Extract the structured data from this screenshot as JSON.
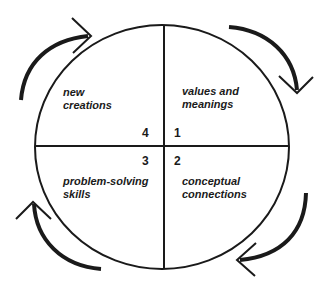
{
  "diagram": {
    "type": "cycle",
    "quadrants": [
      {
        "number": "1",
        "line1": "values and",
        "line2": "meanings",
        "position": "top-right"
      },
      {
        "number": "2",
        "line1": "conceptual",
        "line2": "connections",
        "position": "bottom-right"
      },
      {
        "number": "3",
        "line1": "problem-solving",
        "line2": "skills",
        "position": "bottom-left"
      },
      {
        "number": "4",
        "line1": "new",
        "line2": "creations",
        "position": "top-left"
      }
    ],
    "arrows": {
      "direction": "clockwise",
      "count": 4
    },
    "colors": {
      "stroke": "#1a1a1a",
      "background": "#ffffff"
    }
  }
}
